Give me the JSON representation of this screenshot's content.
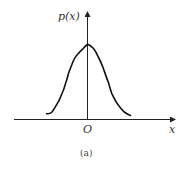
{
  "figure": {
    "y_axis_label": "p(x)",
    "x_axis_label": "x",
    "origin_label": "O",
    "caption": "(a)",
    "curve_description": "bell-shaped probability density curve centered at origin",
    "colors": {
      "line": "#111111",
      "axis": "#222222",
      "text": "#333333"
    }
  }
}
